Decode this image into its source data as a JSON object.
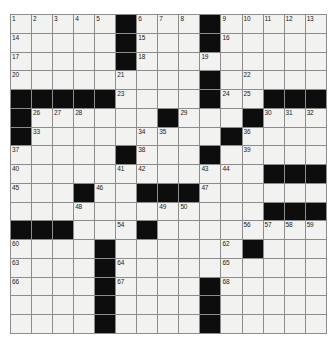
{
  "puzzle": {
    "type": "crossword-grid",
    "columns": 15,
    "rows": 17,
    "colors": {
      "block": "#0d0d0d",
      "open": "#f2f2f0",
      "rule": "#8c8c8c",
      "number": "#1a1a1a",
      "page": "#ffffff"
    },
    "grid": [
      "OOOOO#OOO#OOOOO",
      "OOOOO#OOO#OOOOO",
      "OOOOO#OOOOOOOOO",
      "OOOOOOOOO#OOOOO",
      "#####OOOO#OO###",
      "#OOOOOO#OOO#OOO",
      "#OOOOOOOOO#OOOO",
      "OOOOO#OOO#OOOOO",
      "OOOOOOOOOOOO###",
      "OOO#OO###OOOOOO",
      "OOOOOOOOOOOO###",
      "###OOO#OOOOOOOO",
      "OOOO#OOOOOO#OOO",
      "OOOO#OOOOOOOOOO",
      "OOOO#OOOO#OOOOO",
      "OOOO#OOOO#OOOOO",
      "OOOO#OOOO#OOOOO"
    ],
    "numbers": [
      {
        "r": 0,
        "c": 0,
        "n": "1"
      },
      {
        "r": 0,
        "c": 1,
        "n": "2"
      },
      {
        "r": 0,
        "c": 2,
        "n": "3"
      },
      {
        "r": 0,
        "c": 3,
        "n": "4"
      },
      {
        "r": 0,
        "c": 4,
        "n": "5"
      },
      {
        "r": 0,
        "c": 6,
        "n": "6"
      },
      {
        "r": 0,
        "c": 7,
        "n": "7"
      },
      {
        "r": 0,
        "c": 8,
        "n": "8"
      },
      {
        "r": 0,
        "c": 10,
        "n": "9"
      },
      {
        "r": 0,
        "c": 11,
        "n": "10"
      },
      {
        "r": 0,
        "c": 12,
        "n": "11"
      },
      {
        "r": 0,
        "c": 13,
        "n": "12"
      },
      {
        "r": 0,
        "c": 14,
        "n": "13"
      },
      {
        "r": 1,
        "c": 0,
        "n": "14"
      },
      {
        "r": 1,
        "c": 6,
        "n": "15"
      },
      {
        "r": 1,
        "c": 10,
        "n": "16"
      },
      {
        "r": 2,
        "c": 0,
        "n": "17"
      },
      {
        "r": 2,
        "c": 6,
        "n": "18"
      },
      {
        "r": 2,
        "c": 9,
        "n": "19"
      },
      {
        "r": 3,
        "c": 0,
        "n": "20"
      },
      {
        "r": 3,
        "c": 5,
        "n": "21"
      },
      {
        "r": 3,
        "c": 11,
        "n": "22"
      },
      {
        "r": 4,
        "c": 5,
        "n": "23"
      },
      {
        "r": 4,
        "c": 10,
        "n": "24"
      },
      {
        "r": 4,
        "c": 11,
        "n": "25"
      },
      {
        "r": 5,
        "c": 1,
        "n": "26"
      },
      {
        "r": 5,
        "c": 2,
        "n": "27"
      },
      {
        "r": 5,
        "c": 3,
        "n": "28"
      },
      {
        "r": 5,
        "c": 8,
        "n": "29"
      },
      {
        "r": 5,
        "c": 12,
        "n": "30"
      },
      {
        "r": 5,
        "c": 13,
        "n": "31"
      },
      {
        "r": 5,
        "c": 14,
        "n": "32"
      },
      {
        "r": 6,
        "c": 1,
        "n": "33"
      },
      {
        "r": 6,
        "c": 6,
        "n": "34"
      },
      {
        "r": 6,
        "c": 7,
        "n": "35"
      },
      {
        "r": 6,
        "c": 11,
        "n": "36"
      },
      {
        "r": 7,
        "c": 0,
        "n": "37"
      },
      {
        "r": 7,
        "c": 6,
        "n": "38"
      },
      {
        "r": 7,
        "c": 11,
        "n": "39"
      },
      {
        "r": 8,
        "c": 0,
        "n": "40"
      },
      {
        "r": 8,
        "c": 5,
        "n": "41"
      },
      {
        "r": 8,
        "c": 6,
        "n": "42"
      },
      {
        "r": 8,
        "c": 9,
        "n": "43"
      },
      {
        "r": 8,
        "c": 10,
        "n": "44"
      },
      {
        "r": 9,
        "c": 0,
        "n": "45"
      },
      {
        "r": 9,
        "c": 4,
        "n": "46"
      },
      {
        "r": 9,
        "c": 9,
        "n": "47"
      },
      {
        "r": 10,
        "c": 3,
        "n": "48"
      },
      {
        "r": 10,
        "c": 7,
        "n": "49"
      },
      {
        "r": 10,
        "c": 8,
        "n": "50"
      },
      {
        "r": 11,
        "c": 0,
        "n": "51"
      },
      {
        "r": 11,
        "c": 1,
        "n": "52"
      },
      {
        "r": 11,
        "c": 2,
        "n": "53"
      },
      {
        "r": 11,
        "c": 5,
        "n": "54"
      },
      {
        "r": 11,
        "c": 6,
        "n": "55"
      },
      {
        "r": 11,
        "c": 11,
        "n": "56"
      },
      {
        "r": 11,
        "c": 12,
        "n": "57"
      },
      {
        "r": 11,
        "c": 13,
        "n": "58"
      },
      {
        "r": 11,
        "c": 14,
        "n": "59"
      },
      {
        "r": 12,
        "c": 0,
        "n": "60"
      },
      {
        "r": 12,
        "c": 4,
        "n": "61"
      },
      {
        "r": 12,
        "c": 10,
        "n": "62"
      },
      {
        "r": 13,
        "c": 0,
        "n": "63"
      },
      {
        "r": 13,
        "c": 5,
        "n": "64"
      },
      {
        "r": 13,
        "c": 10,
        "n": "65"
      },
      {
        "r": 14,
        "c": 0,
        "n": "66"
      },
      {
        "r": 14,
        "c": 5,
        "n": "67"
      },
      {
        "r": 14,
        "c": 10,
        "n": "68"
      }
    ]
  }
}
